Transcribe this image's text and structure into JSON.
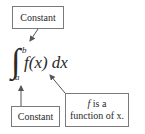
{
  "diagram": {
    "expression": {
      "integral_symbol": "∫",
      "upper_limit": "b",
      "lower_limit": "a",
      "integrand": "f(x) dx"
    },
    "labels": {
      "top": "Constant",
      "bottom_left": "Constant",
      "bottom_right_line1_var": "f",
      "bottom_right_line1_rest": " is a",
      "bottom_right_line2": "function of x."
    },
    "colors": {
      "text": "#2a2a2a",
      "border": "#7a7a7a",
      "arrow": "#555555"
    }
  }
}
